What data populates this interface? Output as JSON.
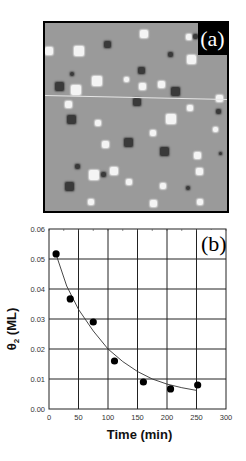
{
  "figure": {
    "panel_a": {
      "label": "(a)",
      "description": "STM image of surface with bright and dark square islands",
      "bright_features": [
        {
          "x": 4,
          "y": 28,
          "s": 8
        },
        {
          "x": 34,
          "y": 28,
          "s": 10
        },
        {
          "x": 99,
          "y": 11,
          "s": 8
        },
        {
          "x": 144,
          "y": 14,
          "s": 6
        },
        {
          "x": 146,
          "y": 36,
          "s": 9
        },
        {
          "x": 52,
          "y": 58,
          "s": 10
        },
        {
          "x": 31,
          "y": 67,
          "s": 10
        },
        {
          "x": 97,
          "y": 63,
          "s": 7
        },
        {
          "x": 116,
          "y": 61,
          "s": 7
        },
        {
          "x": 81,
          "y": 56,
          "s": 5
        },
        {
          "x": 174,
          "y": 75,
          "s": 7
        },
        {
          "x": 23,
          "y": 81,
          "s": 7
        },
        {
          "x": 145,
          "y": 85,
          "s": 6
        },
        {
          "x": 126,
          "y": 96,
          "s": 10
        },
        {
          "x": 53,
          "y": 100,
          "s": 6
        },
        {
          "x": 108,
          "y": 110,
          "s": 6
        },
        {
          "x": 60,
          "y": 121,
          "s": 7
        },
        {
          "x": 152,
          "y": 132,
          "s": 7
        },
        {
          "x": 49,
          "y": 152,
          "s": 10
        },
        {
          "x": 69,
          "y": 148,
          "s": 8
        },
        {
          "x": 154,
          "y": 148,
          "s": 7
        },
        {
          "x": 84,
          "y": 159,
          "s": 6
        },
        {
          "x": 118,
          "y": 163,
          "s": 6
        },
        {
          "x": 46,
          "y": 179,
          "s": 6
        },
        {
          "x": 108,
          "y": 180,
          "s": 7
        },
        {
          "x": 155,
          "y": 179,
          "s": 6
        },
        {
          "x": 170,
          "y": 106,
          "s": 5
        }
      ],
      "dark_features": [
        {
          "x": 62,
          "y": 21,
          "s": 7
        },
        {
          "x": 125,
          "y": 31,
          "s": 5
        },
        {
          "x": 27,
          "y": 51,
          "s": 4
        },
        {
          "x": 96,
          "y": 47,
          "s": 7
        },
        {
          "x": 14,
          "y": 63,
          "s": 9
        },
        {
          "x": 130,
          "y": 68,
          "s": 9
        },
        {
          "x": 92,
          "y": 79,
          "s": 8
        },
        {
          "x": 26,
          "y": 96,
          "s": 9
        },
        {
          "x": 173,
          "y": 88,
          "s": 5
        },
        {
          "x": 83,
          "y": 119,
          "s": 9
        },
        {
          "x": 119,
          "y": 128,
          "s": 9
        },
        {
          "x": 32,
          "y": 143,
          "s": 5
        },
        {
          "x": 58,
          "y": 151,
          "s": 5
        },
        {
          "x": 24,
          "y": 163,
          "s": 9
        },
        {
          "x": 143,
          "y": 165,
          "s": 4
        },
        {
          "x": 175,
          "y": 130,
          "s": 3
        },
        {
          "x": 150,
          "y": 13,
          "s": 5
        }
      ],
      "scan_line": {
        "y_left": 72,
        "y_right": 76
      }
    },
    "panel_b": {
      "label": "(b)"
    }
  },
  "chart_data": {
    "type": "scatter",
    "title": "",
    "panel_label": "(b)",
    "xlabel": "Time (min)",
    "ylabel": "θ2 (ML)",
    "ylabel_main": "θ",
    "ylabel_sub": "2",
    "ylabel_unit": "(ML)",
    "xlim": [
      0,
      300
    ],
    "ylim": [
      0.0,
      0.06
    ],
    "grid": true,
    "x_ticks": [
      0,
      50,
      100,
      150,
      200,
      250,
      300
    ],
    "x_tick_labels": [
      "0",
      "50",
      "100",
      "150",
      "200",
      "250",
      "300"
    ],
    "y_ticks": [
      0.0,
      0.01,
      0.02,
      0.03,
      0.04,
      0.05,
      0.06
    ],
    "y_tick_labels": [
      "0.00",
      "0.01",
      "0.02",
      "0.03",
      "0.04",
      "0.05",
      "0.06"
    ],
    "series": [
      {
        "name": "measured",
        "marker": "filled-circle",
        "x": [
          12,
          36,
          75,
          111,
          160,
          206,
          252
        ],
        "y": [
          0.0517,
          0.0367,
          0.029,
          0.016,
          0.009,
          0.0067,
          0.008
        ]
      },
      {
        "name": "fit",
        "style": "line",
        "x": [
          12,
          30,
          50,
          75,
          100,
          125,
          150,
          175,
          200,
          225,
          250
        ],
        "y": [
          0.0515,
          0.041,
          0.0332,
          0.026,
          0.02,
          0.0158,
          0.0125,
          0.01,
          0.0083,
          0.0071,
          0.0062
        ]
      }
    ],
    "legend": null
  }
}
